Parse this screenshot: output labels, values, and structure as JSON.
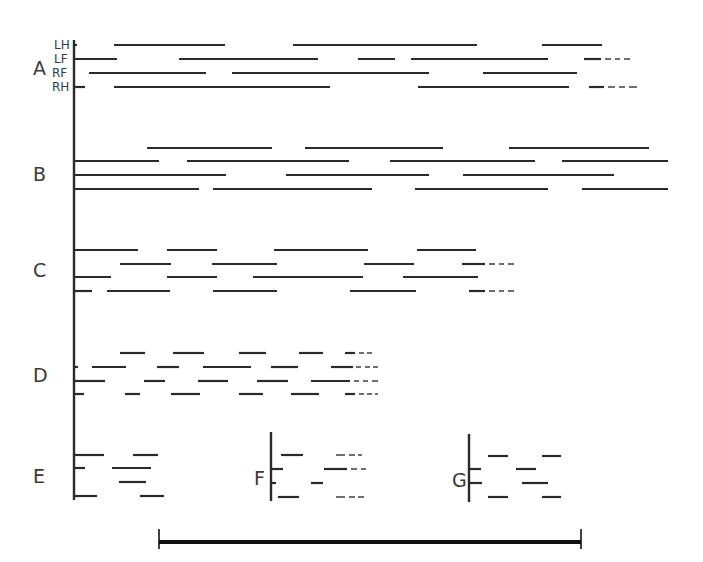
{
  "figure": {
    "ink_color": "#2a2a2a",
    "stroke_width": 2.2
  },
  "limb_labels": [
    {
      "text": "LH",
      "x": 54,
      "y": 49
    },
    {
      "text": "LF",
      "x": 54,
      "y": 63
    },
    {
      "text": "RF",
      "x": 52,
      "y": 77
    },
    {
      "text": "RH",
      "x": 52,
      "y": 91
    }
  ],
  "axes": [
    {
      "id": "main",
      "x": 74,
      "y1": 40,
      "y2": 500
    },
    {
      "id": "F",
      "x": 271,
      "y1": 432,
      "y2": 501
    },
    {
      "id": "G",
      "x": 469,
      "y1": 434,
      "y2": 502
    }
  ],
  "panels": [
    {
      "id": "A",
      "label": "A",
      "label_x": 33,
      "label_y": 75,
      "rows": [
        {
          "limb": "LH",
          "y": 45,
          "segments": [
            [
              74,
              77
            ],
            [
              114,
              225
            ],
            [
              293,
              477
            ],
            [
              542,
              602
            ]
          ],
          "dashes": []
        },
        {
          "limb": "LF",
          "y": 59,
          "segments": [
            [
              74,
              117
            ],
            [
              179,
              318
            ],
            [
              358,
              395
            ],
            [
              411,
              548
            ],
            [
              584,
              601
            ]
          ],
          "dashes": [
            [
              605,
              611
            ],
            [
              615,
              620
            ],
            [
              624,
              630
            ]
          ]
        },
        {
          "limb": "RF",
          "y": 73,
          "segments": [
            [
              89,
              206
            ],
            [
              232,
              429
            ],
            [
              483,
              577
            ]
          ],
          "dashes": []
        },
        {
          "limb": "RH",
          "y": 87,
          "segments": [
            [
              74,
              85
            ],
            [
              114,
              330
            ],
            [
              418,
              569
            ],
            [
              589,
              604
            ]
          ],
          "dashes": [
            [
              608,
              615
            ],
            [
              619,
              625
            ],
            [
              629,
              637
            ]
          ]
        }
      ]
    },
    {
      "id": "B",
      "label": "B",
      "label_x": 33,
      "label_y": 181,
      "rows": [
        {
          "y": 148,
          "segments": [
            [
              147,
              272
            ],
            [
              305,
              443
            ],
            [
              509,
              649
            ]
          ],
          "dashes": []
        },
        {
          "y": 161,
          "segments": [
            [
              74,
              159
            ],
            [
              187,
              349
            ],
            [
              390,
              535
            ],
            [
              562,
              668
            ]
          ],
          "dashes": []
        },
        {
          "y": 175,
          "segments": [
            [
              74,
              226
            ],
            [
              286,
              429
            ],
            [
              463,
              614
            ]
          ],
          "dashes": []
        },
        {
          "y": 189,
          "segments": [
            [
              74,
              199
            ],
            [
              213,
              372
            ],
            [
              415,
              548
            ],
            [
              582,
              668
            ]
          ],
          "dashes": []
        }
      ]
    },
    {
      "id": "C",
      "label": "C",
      "label_x": 33,
      "label_y": 277,
      "rows": [
        {
          "y": 250,
          "segments": [
            [
              74,
              138
            ],
            [
              167,
              217
            ],
            [
              274,
              368
            ],
            [
              417,
              476
            ]
          ],
          "dashes": []
        },
        {
          "y": 264,
          "segments": [
            [
              120,
              171
            ],
            [
              212,
              277
            ],
            [
              364,
              414
            ],
            [
              462,
              485
            ]
          ],
          "dashes": [
            [
              489,
              495
            ],
            [
              499,
              504
            ],
            [
              508,
              514
            ]
          ]
        },
        {
          "y": 277,
          "segments": [
            [
              74,
              111
            ],
            [
              167,
              217
            ],
            [
              253,
              363
            ],
            [
              403,
              478
            ]
          ],
          "dashes": []
        },
        {
          "y": 291,
          "segments": [
            [
              74,
              92
            ],
            [
              107,
              170
            ],
            [
              213,
              277
            ],
            [
              350,
              416
            ],
            [
              469,
              485
            ]
          ],
          "dashes": [
            [
              489,
              495
            ],
            [
              499,
              504
            ],
            [
              508,
              514
            ]
          ]
        }
      ]
    },
    {
      "id": "D",
      "label": "D",
      "label_x": 33,
      "label_y": 382,
      "rows": [
        {
          "y": 353,
          "segments": [
            [
              120,
              145
            ],
            [
              173,
              204
            ],
            [
              239,
              266
            ],
            [
              299,
              323
            ],
            [
              345,
              355
            ]
          ],
          "dashes": [
            [
              359,
              364
            ],
            [
              367,
              372
            ]
          ]
        },
        {
          "y": 367,
          "segments": [
            [
              74,
              78
            ],
            [
              92,
              126
            ],
            [
              157,
              179
            ],
            [
              203,
              251
            ],
            [
              271,
              298
            ],
            [
              331,
              353
            ]
          ],
          "dashes": [
            [
              356,
              361
            ],
            [
              365,
              370
            ],
            [
              373,
              378
            ]
          ]
        },
        {
          "y": 381,
          "segments": [
            [
              74,
              105
            ],
            [
              144,
              165
            ],
            [
              198,
              228
            ],
            [
              257,
              288
            ],
            [
              311,
              350
            ]
          ],
          "dashes": [
            [
              354,
              359
            ],
            [
              363,
              368
            ],
            [
              372,
              378
            ]
          ]
        },
        {
          "y": 394,
          "segments": [
            [
              74,
              84
            ],
            [
              125,
              140
            ],
            [
              171,
              200
            ],
            [
              239,
              263
            ],
            [
              291,
              319
            ],
            [
              345,
              355
            ]
          ],
          "dashes": [
            [
              359,
              364
            ],
            [
              367,
              372
            ],
            [
              375,
              378
            ]
          ]
        }
      ]
    },
    {
      "id": "E",
      "label": "E",
      "label_x": 33,
      "label_y": 483,
      "rows": [
        {
          "y": 455,
          "segments": [
            [
              74,
              104
            ],
            [
              133,
              158
            ]
          ],
          "dashes": []
        },
        {
          "y": 468,
          "segments": [
            [
              74,
              85
            ],
            [
              112,
              151
            ]
          ],
          "dashes": []
        },
        {
          "y": 482,
          "segments": [
            [
              119,
              146
            ]
          ],
          "dashes": []
        },
        {
          "y": 496,
          "segments": [
            [
              74,
              97
            ],
            [
              140,
              164
            ]
          ],
          "dashes": []
        }
      ]
    },
    {
      "id": "F",
      "label": "F",
      "label_x": 254,
      "label_y": 485,
      "rows": [
        {
          "y": 455,
          "segments": [
            [
              281,
              303
            ]
          ],
          "dashes": [
            [
              336,
              345
            ],
            [
              349,
              355
            ],
            [
              358,
              362
            ]
          ]
        },
        {
          "y": 469,
          "segments": [
            [
              271,
              283
            ],
            [
              324,
              347
            ]
          ],
          "dashes": [
            [
              351,
              357
            ],
            [
              361,
              366
            ]
          ]
        },
        {
          "y": 483,
          "segments": [
            [
              271,
              276
            ],
            [
              311,
              323
            ]
          ],
          "dashes": []
        },
        {
          "y": 497,
          "segments": [
            [
              278,
              299
            ]
          ],
          "dashes": [
            [
              336,
              345
            ],
            [
              349,
              355
            ],
            [
              358,
              364
            ]
          ]
        }
      ]
    },
    {
      "id": "G",
      "label": "G",
      "label_x": 452,
      "label_y": 487,
      "rows": [
        {
          "y": 456,
          "segments": [
            [
              488,
              508
            ],
            [
              542,
              561
            ]
          ],
          "dashes": []
        },
        {
          "y": 469,
          "segments": [
            [
              469,
              481
            ],
            [
              516,
              536
            ]
          ],
          "dashes": []
        },
        {
          "y": 483,
          "segments": [
            [
              469,
              482
            ],
            [
              522,
              548
            ]
          ],
          "dashes": []
        },
        {
          "y": 497,
          "segments": [
            [
              488,
              508
            ],
            [
              542,
              561
            ]
          ],
          "dashes": []
        }
      ]
    }
  ],
  "scale_bar": {
    "x1": 159,
    "x2": 581,
    "y": 542,
    "thickness": 4,
    "cap_top": 529,
    "cap_bottom": 549
  }
}
